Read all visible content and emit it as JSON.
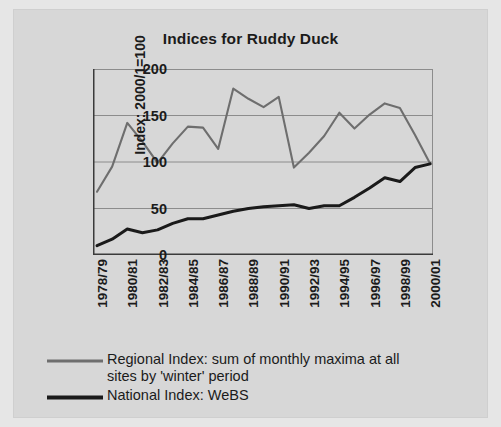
{
  "chart_data": {
    "type": "line",
    "title": "Indices for Ruddy Duck",
    "xlabel": "",
    "ylabel": "Index: 2000/1=100",
    "ylim": [
      0,
      200
    ],
    "yticks": [
      0,
      50,
      100,
      150,
      200
    ],
    "grid": true,
    "legend_position": "bottom",
    "x": [
      "1978/79",
      "1979/80",
      "1980/81",
      "1981/82",
      "1982/83",
      "1983/84",
      "1984/85",
      "1985/86",
      "1986/87",
      "1987/88",
      "1988/89",
      "1989/90",
      "1990/91",
      "1991/92",
      "1992/93",
      "1993/94",
      "1994/95",
      "1995/96",
      "1996/97",
      "1997/98",
      "1998/99",
      "1999/00",
      "2000/01"
    ],
    "xtick_labels": [
      "1978/79",
      "1980/81",
      "1982/83",
      "1984/85",
      "1986/87",
      "1988/89",
      "1990/91",
      "1992/93",
      "1994/95",
      "1996/97",
      "1998/99",
      "2000/01"
    ],
    "series": [
      {
        "name": "Regional Index: sum of monthly maxima at all sites by 'winter' period",
        "color": "#6e6e6e",
        "values": [
          68,
          95,
          142,
          122,
          99,
          120,
          138,
          137,
          114,
          179,
          168,
          159,
          170,
          94,
          110,
          128,
          153,
          136,
          151,
          163,
          158,
          129,
          98
        ]
      },
      {
        "name": "National Index: WeBS",
        "color": "#1a1a1a",
        "values": [
          10,
          17,
          28,
          24,
          27,
          34,
          39,
          39,
          43,
          47,
          50,
          52,
          53,
          54,
          50,
          53,
          53,
          62,
          72,
          83,
          79,
          94,
          98
        ]
      }
    ]
  },
  "legend": {
    "items": [
      {
        "line1": "Regional Index: sum of monthly maxima at all",
        "line2": "sites by 'winter' period",
        "swatch": "gray-line-swatch"
      },
      {
        "line1": "National Index: WeBS",
        "line2": "",
        "swatch": "black-line-swatch"
      }
    ]
  },
  "colors": {
    "background": "#d7d7d7",
    "page_edge": "#e6e6e6",
    "axis": "#3a3a3a",
    "grid": "#8c8c8c",
    "regional_line": "#6e6e6e",
    "national_line": "#1a1a1a",
    "text": "#1b1b1b"
  }
}
